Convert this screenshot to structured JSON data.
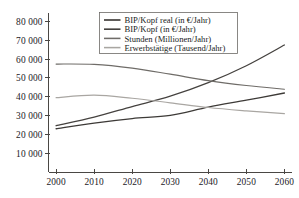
{
  "chart_data": {
    "type": "line",
    "title": "",
    "xlabel": "",
    "ylabel": "",
    "x": [
      2000,
      2010,
      2020,
      2030,
      2040,
      2050,
      2060
    ],
    "xlim": [
      1998,
      2062
    ],
    "ylim": [
      0,
      84000
    ],
    "xticks": [
      "2000",
      "2010",
      "2020",
      "2030",
      "2040",
      "2050",
      "2060"
    ],
    "yticks": [
      "10 000",
      "20 000",
      "30 000",
      "40 000",
      "50 000",
      "60 000",
      "70 000",
      "80 000"
    ],
    "ytick_values": [
      10000,
      20000,
      30000,
      40000,
      50000,
      60000,
      70000,
      80000
    ],
    "grid": false,
    "legend_position": "top-center",
    "series": [
      {
        "name": "BIP/Kopf real (in €/Jahr)",
        "color": "#3d3a37",
        "width": 1.3,
        "values": [
          23000,
          26000,
          28400,
          30100,
          34500,
          38200,
          42000
        ]
      },
      {
        "name": "BIP/Kopf (in €/Jahr)",
        "color": "#45423f",
        "width": 1.3,
        "values": [
          24600,
          29200,
          34800,
          40300,
          47500,
          56500,
          67500
        ]
      },
      {
        "name": "Stunden (Millionen/Jahr)",
        "color": "#6f6c68",
        "width": 1.2,
        "values": [
          57400,
          57200,
          55200,
          52000,
          48600,
          46000,
          44000
        ]
      },
      {
        "name": "Erwerbstätige (Tausend/Jahr)",
        "color": "#a9a6a2",
        "width": 1.2,
        "values": [
          39500,
          40900,
          39200,
          36800,
          34300,
          32500,
          31000
        ]
      }
    ]
  },
  "axes": {
    "x_axis_name": "year-axis",
    "y_axis_name": "value-axis"
  }
}
